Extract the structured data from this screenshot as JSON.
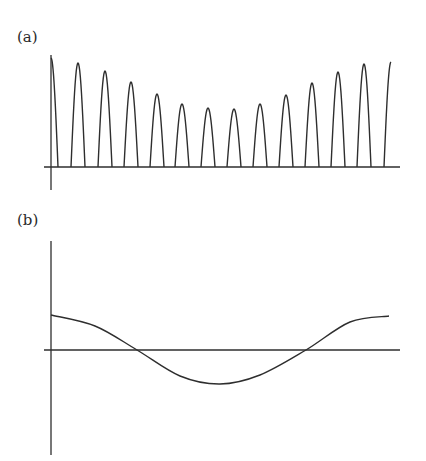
{
  "figure": {
    "panels": [
      {
        "id": "a",
        "label": "(a)",
        "description": "Rectified periodic arches with amplitude modulated envelope (large at ends, small in middle)"
      },
      {
        "id": "b",
        "label": "(b)",
        "description": "Smooth cosine-like curve over one period: starts positive, crosses zero, reaches minimum, returns positive"
      }
    ],
    "colors": {
      "line": "#2e2e2e",
      "background": "#ffffff"
    }
  },
  "chart_data": [
    {
      "type": "line",
      "title": "(a)",
      "xlabel": "",
      "ylabel": "",
      "grid": false,
      "axes": {
        "origin_px": [
          51,
          167
        ],
        "x_end_px": 400,
        "y_top_px": 55,
        "y_bottom_px": 190
      },
      "series": [
        {
          "name": "rectified arches",
          "arch_peak_x": [
            51,
            78,
            105,
            131,
            157,
            182,
            208,
            234,
            260,
            286,
            312,
            338,
            364,
            391
          ],
          "arch_peak_y": [
            58,
            63,
            71,
            82,
            94,
            104,
            108,
            109,
            104,
            95,
            83,
            72,
            64,
            62
          ],
          "relative_heights": [
            1.0,
            0.95,
            0.88,
            0.78,
            0.67,
            0.58,
            0.54,
            0.53,
            0.58,
            0.66,
            0.77,
            0.87,
            0.94,
            0.96
          ]
        }
      ]
    },
    {
      "type": "line",
      "title": "(b)",
      "xlabel": "",
      "ylabel": "",
      "grid": false,
      "axes": {
        "origin_px": [
          51,
          350
        ],
        "x_end_px": 400,
        "y_top_px": 241,
        "y_bottom_px": 455
      },
      "series": [
        {
          "name": "envelope",
          "x_px": [
            51,
            95,
            137,
            180,
            220,
            260,
            306,
            350,
            389
          ],
          "y_px": [
            315,
            326,
            350,
            376,
            384,
            375,
            350,
            322,
            316
          ],
          "relative_values": [
            1.0,
            0.68,
            0.0,
            -0.74,
            -1.0,
            -0.72,
            0.0,
            0.8,
            1.0
          ]
        }
      ]
    }
  ]
}
